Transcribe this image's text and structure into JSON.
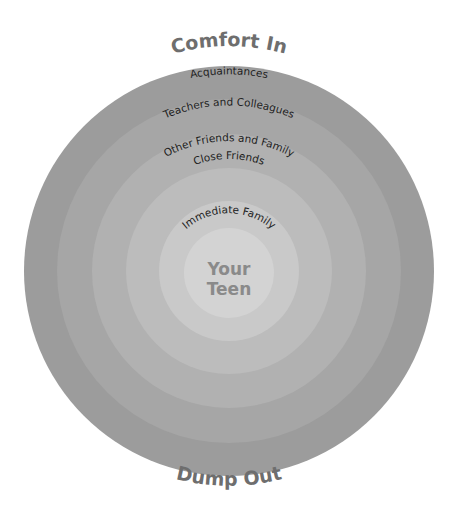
{
  "diagram": {
    "type": "concentric-circles",
    "top_title": "Comfort In",
    "bottom_title": "Dump Out",
    "center": {
      "label_line1": "Your",
      "label_line2": "Teen",
      "color": "#d3d3d3"
    },
    "rings": [
      {
        "label": "Immediate Family",
        "color": "#c9c9c9"
      },
      {
        "label": "Close Friends",
        "color": "#bcbcbc"
      },
      {
        "label": "Other Friends and Family",
        "color": "#b1b1b1"
      },
      {
        "label": "Teachers and Colleagues",
        "color": "#a6a6a6"
      },
      {
        "label": "Acquaintances",
        "color": "#9c9c9c"
      }
    ],
    "colors": {
      "title": "#6e6e6e",
      "ring_label": "#1e1e1e",
      "center_label": "#8a8a8a",
      "background": "#ffffff"
    }
  }
}
